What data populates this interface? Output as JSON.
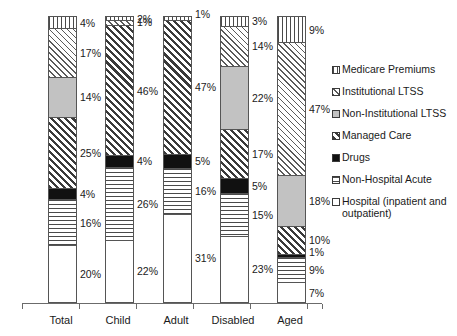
{
  "chart_data": {
    "type": "bar",
    "subtype": "stacked-bar-100-percent",
    "title": "",
    "xlabel": "",
    "ylabel": "",
    "ylim": [
      0,
      100
    ],
    "grid": false,
    "legend_position": "right",
    "categories": [
      "Total",
      "Child",
      "Adult",
      "Disabled",
      "Aged"
    ],
    "series": [
      {
        "name": "Hospital (inpatient and outpatient)",
        "fill": "f-hospital",
        "values": [
          20,
          22,
          31,
          23,
          7
        ],
        "labels": [
          "20%",
          "22%",
          "31%",
          "23%",
          "7%"
        ]
      },
      {
        "name": "Non-Hospital Acute",
        "fill": "f-nonhospacute",
        "values": [
          16,
          26,
          16,
          15,
          9
        ],
        "labels": [
          "16%",
          "26%",
          "16%",
          "15%",
          "9%"
        ]
      },
      {
        "name": "Drugs",
        "fill": "f-drugs",
        "values": [
          4,
          4,
          5,
          5,
          1
        ],
        "labels": [
          "4%",
          "4%",
          "5%",
          "5%",
          "1%"
        ]
      },
      {
        "name": "Managed Care",
        "fill": "f-managedcare",
        "values": [
          25,
          46,
          47,
          17,
          10
        ],
        "labels": [
          "25%",
          "46%",
          "47%",
          "17%",
          "10%"
        ]
      },
      {
        "name": "Non-Institutional LTSS",
        "fill": "f-noninstltss",
        "values": [
          14,
          0,
          0,
          22,
          18
        ],
        "labels": [
          "14%",
          "",
          "",
          "22%",
          "18%"
        ]
      },
      {
        "name": "Institutional LTSS",
        "fill": "f-instltss",
        "values": [
          17,
          2,
          0,
          14,
          47
        ],
        "labels": [
          "17%",
          "2%",
          "",
          "14%",
          "47%"
        ]
      },
      {
        "name": "Medicare Premiums",
        "fill": "f-medicare",
        "values": [
          4,
          1,
          1,
          3,
          9
        ],
        "labels": [
          "4%",
          "1%",
          "1%",
          "3%",
          "9%"
        ]
      }
    ]
  },
  "legend": {
    "items": [
      {
        "label": "Medicare Premiums",
        "fill": "f-medicare"
      },
      {
        "label": "Institutional LTSS",
        "fill": "f-instltss"
      },
      {
        "label": "Non-Institutional LTSS",
        "fill": "f-noninstltss"
      },
      {
        "label": "Managed Care",
        "fill": "f-managedcare"
      },
      {
        "label": "Drugs",
        "fill": "f-drugs"
      },
      {
        "label": "Non-Hospital Acute",
        "fill": "f-nonhospacute"
      },
      {
        "label": "Hospital (inpatient and outpatient)",
        "fill": "f-hospital"
      }
    ]
  },
  "axis": {
    "categories": [
      "Total",
      "Child",
      "Adult",
      "Disabled",
      "Aged"
    ]
  }
}
